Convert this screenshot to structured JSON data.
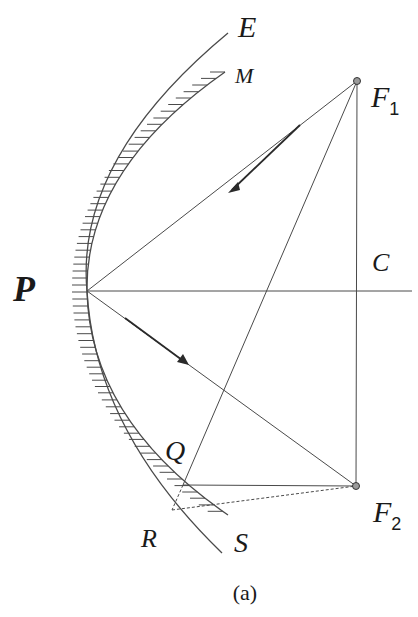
{
  "figure": {
    "caption": "(a)",
    "labels": {
      "E": "E",
      "M": "M",
      "F1_main": "F",
      "F1_sub": "1",
      "C": "C",
      "P": "P",
      "Q": "Q",
      "F2_main": "F",
      "F2_sub": "2",
      "R": "R",
      "S": "S"
    },
    "points": {
      "P": [
        87,
        291
      ],
      "F1": [
        357,
        81
      ],
      "F2": [
        356,
        486
      ],
      "Q": [
        183,
        485
      ],
      "R": [
        172,
        510
      ],
      "C": [
        357,
        291
      ]
    },
    "curves": [
      {
        "name": "outer-mirror-E-S",
        "label_top": "E",
        "label_bottom": "S",
        "hatched": false
      },
      {
        "name": "inner-mirror-M",
        "label_top": "M",
        "hatched": true
      }
    ],
    "rays": [
      {
        "from": "F1",
        "to": "P",
        "arrow": true
      },
      {
        "from": "P",
        "to": "F2",
        "arrow": true
      }
    ],
    "colors": {
      "line": "#4a4a4a",
      "text": "#1a1a1a",
      "background": "#ffffff"
    }
  }
}
